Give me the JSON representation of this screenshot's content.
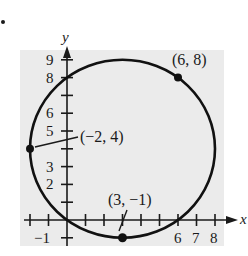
{
  "figure": {
    "marker": "•",
    "background_color": "#ebebeb",
    "axes": {
      "x_label": "x",
      "y_label": "y",
      "x_tick_labels": [
        {
          "value": -1,
          "text": "−1"
        },
        {
          "value": 6,
          "text": "6"
        },
        {
          "value": 7,
          "text": "7"
        },
        {
          "value": 8,
          "text": "8"
        }
      ],
      "y_tick_labels": [
        {
          "value": 2,
          "text": "2"
        },
        {
          "value": 3,
          "text": "3"
        },
        {
          "value": 5,
          "text": "5"
        },
        {
          "value": 6,
          "text": "6"
        },
        {
          "value": 8,
          "text": "8"
        },
        {
          "value": 9,
          "text": "9"
        }
      ],
      "x_ticks": [
        -2,
        -1,
        1,
        2,
        3,
        4,
        5,
        6,
        7,
        8
      ],
      "y_ticks": [
        -1,
        1,
        2,
        3,
        4,
        5,
        6,
        7,
        8,
        9
      ]
    },
    "circle": {
      "center": [
        3,
        4
      ],
      "radius": 5
    },
    "points": [
      {
        "x": 6,
        "y": 8,
        "label": "(6, 8)"
      },
      {
        "x": -2,
        "y": 4,
        "label": "(−2, 4)"
      },
      {
        "x": 3,
        "y": -1,
        "label": "(3, −1)"
      }
    ]
  }
}
